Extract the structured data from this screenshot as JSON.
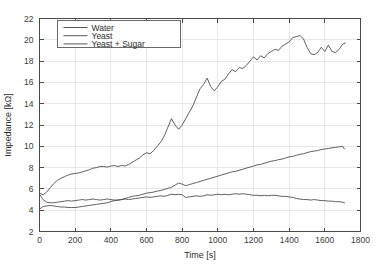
{
  "chart_data": {
    "type": "line",
    "title": "",
    "xlabel": "Time [s]",
    "ylabel": "Impedance [kΩ]",
    "xlim": [
      0,
      1800
    ],
    "ylim": [
      2,
      22
    ],
    "xticks": [
      0,
      200,
      400,
      600,
      800,
      1000,
      1200,
      1400,
      1600,
      1800
    ],
    "yticks": [
      2,
      4,
      6,
      8,
      10,
      12,
      14,
      16,
      18,
      20,
      22
    ],
    "grid": true,
    "legend_position": "upper-left-inset",
    "line_color": "#454545",
    "grid_color": "#e8e8e8",
    "axis_color": "#4a4a4a",
    "background": "#ffffff",
    "series": [
      {
        "name": "Water",
        "x": [
          0,
          20,
          40,
          60,
          80,
          100,
          120,
          140,
          160,
          180,
          200,
          220,
          240,
          260,
          280,
          300,
          320,
          340,
          360,
          380,
          400,
          420,
          440,
          460,
          480,
          500,
          520,
          540,
          560,
          580,
          600,
          620,
          640,
          660,
          680,
          700,
          720,
          740,
          760,
          780,
          800,
          820,
          840,
          860,
          880,
          900,
          920,
          940,
          960,
          980,
          1000,
          1020,
          1040,
          1060,
          1080,
          1100,
          1120,
          1140,
          1160,
          1180,
          1200,
          1220,
          1240,
          1260,
          1280,
          1300,
          1320,
          1340,
          1360,
          1380,
          1400,
          1420,
          1440,
          1460,
          1480,
          1500,
          1520,
          1540,
          1560,
          1580,
          1600,
          1620,
          1640,
          1660,
          1680,
          1700,
          1710
        ],
        "y": [
          5.5,
          5.0,
          4.75,
          4.7,
          4.7,
          4.75,
          4.8,
          4.85,
          4.9,
          4.85,
          4.9,
          4.95,
          5.0,
          4.95,
          5.0,
          5.05,
          5.0,
          4.95,
          5.0,
          5.05,
          5.0,
          4.95,
          4.95,
          5.0,
          5.05,
          5.0,
          5.05,
          5.1,
          5.15,
          5.2,
          5.25,
          5.2,
          5.25,
          5.3,
          5.35,
          5.3,
          5.4,
          5.5,
          5.45,
          5.5,
          5.45,
          5.2,
          5.25,
          5.3,
          5.35,
          5.3,
          5.35,
          5.45,
          5.4,
          5.45,
          5.5,
          5.45,
          5.5,
          5.45,
          5.5,
          5.55,
          5.5,
          5.55,
          5.5,
          5.45,
          5.4,
          5.4,
          5.35,
          5.4,
          5.35,
          5.4,
          5.4,
          5.35,
          5.3,
          5.3,
          5.25,
          5.2,
          5.1,
          5.05,
          5.0,
          5.0,
          4.95,
          5.0,
          4.95,
          4.9,
          4.9,
          4.85,
          4.85,
          4.8,
          4.8,
          4.75,
          4.7
        ]
      },
      {
        "name": "Yeast",
        "x": [
          0,
          20,
          40,
          60,
          80,
          100,
          120,
          140,
          160,
          180,
          200,
          220,
          240,
          260,
          280,
          300,
          320,
          340,
          360,
          380,
          400,
          420,
          440,
          460,
          480,
          500,
          520,
          540,
          560,
          580,
          600,
          620,
          640,
          660,
          680,
          700,
          720,
          740,
          760,
          780,
          800,
          820,
          840,
          860,
          880,
          900,
          920,
          940,
          960,
          980,
          1000,
          1020,
          1040,
          1060,
          1080,
          1100,
          1120,
          1140,
          1160,
          1180,
          1200,
          1220,
          1240,
          1260,
          1280,
          1300,
          1320,
          1340,
          1360,
          1380,
          1400,
          1420,
          1440,
          1460,
          1480,
          1500,
          1520,
          1540,
          1560,
          1580,
          1600,
          1620,
          1640,
          1660,
          1680,
          1700,
          1710
        ],
        "y": [
          4.1,
          4.35,
          4.4,
          4.45,
          4.4,
          4.35,
          4.3,
          4.3,
          4.25,
          4.25,
          4.25,
          4.3,
          4.35,
          4.4,
          4.45,
          4.5,
          4.55,
          4.6,
          4.65,
          4.7,
          4.8,
          4.9,
          4.95,
          5.0,
          5.1,
          5.2,
          5.3,
          5.35,
          5.4,
          5.5,
          5.6,
          5.65,
          5.7,
          5.8,
          5.85,
          5.95,
          6.05,
          6.15,
          6.35,
          6.55,
          6.45,
          6.3,
          6.4,
          6.5,
          6.6,
          6.7,
          6.8,
          6.9,
          7.0,
          7.1,
          7.2,
          7.3,
          7.4,
          7.5,
          7.6,
          7.65,
          7.75,
          7.85,
          7.95,
          8.05,
          8.15,
          8.25,
          8.3,
          8.4,
          8.5,
          8.6,
          8.65,
          8.75,
          8.8,
          8.9,
          9.0,
          9.05,
          9.15,
          9.25,
          9.3,
          9.4,
          9.5,
          9.55,
          9.6,
          9.7,
          9.75,
          9.8,
          9.85,
          9.9,
          9.95,
          10.0,
          9.75
        ]
      },
      {
        "name": "Yeast + Sugar",
        "x": [
          0,
          20,
          40,
          60,
          80,
          100,
          120,
          140,
          160,
          180,
          200,
          220,
          240,
          260,
          280,
          300,
          320,
          340,
          360,
          380,
          400,
          420,
          440,
          460,
          480,
          500,
          520,
          540,
          560,
          580,
          600,
          620,
          640,
          660,
          680,
          700,
          720,
          740,
          760,
          780,
          800,
          820,
          840,
          860,
          880,
          900,
          920,
          940,
          960,
          980,
          1000,
          1020,
          1040,
          1060,
          1080,
          1100,
          1120,
          1140,
          1160,
          1180,
          1200,
          1220,
          1240,
          1260,
          1280,
          1300,
          1320,
          1340,
          1360,
          1380,
          1400,
          1420,
          1440,
          1460,
          1480,
          1500,
          1520,
          1540,
          1560,
          1580,
          1600,
          1620,
          1640,
          1660,
          1680,
          1700,
          1715
        ],
        "y": [
          5.6,
          5.45,
          5.7,
          6.1,
          6.5,
          6.8,
          7.0,
          7.15,
          7.3,
          7.4,
          7.45,
          7.5,
          7.6,
          7.7,
          7.8,
          7.95,
          8.0,
          8.1,
          8.1,
          8.05,
          8.15,
          8.2,
          8.1,
          8.2,
          8.15,
          8.3,
          8.5,
          8.7,
          8.9,
          9.2,
          9.4,
          9.3,
          9.6,
          10.0,
          10.4,
          11.0,
          11.8,
          12.6,
          12.0,
          11.6,
          12.0,
          12.6,
          13.2,
          13.8,
          14.6,
          15.4,
          15.8,
          16.4,
          15.6,
          15.2,
          15.6,
          16.1,
          16.3,
          16.8,
          17.2,
          17.0,
          17.4,
          17.3,
          17.6,
          18.0,
          18.4,
          18.1,
          18.5,
          18.3,
          18.7,
          18.9,
          19.1,
          19.0,
          19.4,
          19.6,
          19.8,
          20.2,
          20.3,
          20.4,
          20.1,
          19.3,
          18.7,
          18.6,
          18.8,
          19.3,
          18.9,
          19.5,
          18.9,
          18.8,
          19.1,
          19.6,
          19.7
        ]
      }
    ]
  },
  "legend": {
    "entries": [
      "Water",
      "Yeast",
      "Yeast + Sugar"
    ]
  }
}
